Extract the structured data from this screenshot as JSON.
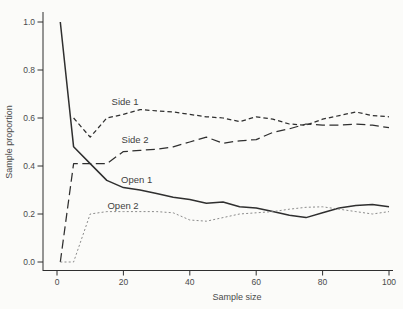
{
  "figure": {
    "background": "#fbfbf9",
    "line_color": "#2f2f2f",
    "muted_line_color": "#8b8b8b",
    "text_color": "#4a4a4a"
  },
  "chart_data": {
    "type": "line",
    "title": "",
    "xlabel": "Sample size",
    "ylabel": "Sample proportion",
    "xlim": [
      0,
      100
    ],
    "ylim": [
      0.0,
      1.0
    ],
    "grid": false,
    "legend": "inline-labels",
    "x_ticks": [
      "0",
      "20",
      "40",
      "60",
      "80",
      "100"
    ],
    "x_tick_values": [
      0,
      20,
      40,
      60,
      80,
      100
    ],
    "y_ticks": [
      "0.0",
      "0.2",
      "0.4",
      "0.6",
      "0.8",
      "1.0"
    ],
    "y_tick_values": [
      0,
      0.2,
      0.4,
      0.6,
      0.8,
      1.0
    ],
    "series": [
      {
        "name": "Side 1",
        "line_style": "short-dash",
        "dash": "4.5 3",
        "width": 1.25,
        "color": "#2f2f2f",
        "label_at": {
          "x": 20.5,
          "y": 0.665
        },
        "points": [
          [
            5,
            0.6
          ],
          [
            10,
            0.52
          ],
          [
            15,
            0.6
          ],
          [
            20,
            0.615
          ],
          [
            25,
            0.635
          ],
          [
            30,
            0.63
          ],
          [
            35,
            0.625
          ],
          [
            40,
            0.615
          ],
          [
            45,
            0.605
          ],
          [
            50,
            0.6
          ],
          [
            55,
            0.585
          ],
          [
            60,
            0.605
          ],
          [
            65,
            0.595
          ],
          [
            70,
            0.575
          ],
          [
            75,
            0.57
          ],
          [
            80,
            0.595
          ],
          [
            85,
            0.61
          ],
          [
            90,
            0.625
          ],
          [
            95,
            0.61
          ],
          [
            100,
            0.605
          ]
        ]
      },
      {
        "name": "Side 2",
        "line_style": "long-dash",
        "dash": "9 4.5",
        "width": 1.25,
        "color": "#2f2f2f",
        "label_at": {
          "x": 23.5,
          "y": 0.508
        },
        "points": [
          [
            1,
            0.0
          ],
          [
            5,
            0.41
          ],
          [
            10,
            0.41
          ],
          [
            15,
            0.41
          ],
          [
            20,
            0.46
          ],
          [
            25,
            0.465
          ],
          [
            30,
            0.47
          ],
          [
            35,
            0.48
          ],
          [
            40,
            0.5
          ],
          [
            45,
            0.52
          ],
          [
            50,
            0.495
          ],
          [
            55,
            0.505
          ],
          [
            60,
            0.51
          ],
          [
            65,
            0.54
          ],
          [
            70,
            0.555
          ],
          [
            75,
            0.575
          ],
          [
            80,
            0.57
          ],
          [
            85,
            0.57
          ],
          [
            90,
            0.575
          ],
          [
            95,
            0.57
          ],
          [
            100,
            0.56
          ]
        ]
      },
      {
        "name": "Open 1",
        "line_style": "solid",
        "dash": "",
        "width": 1.5,
        "color": "#2f2f2f",
        "label_at": {
          "x": 24.0,
          "y": 0.342
        },
        "points": [
          [
            1,
            1.0
          ],
          [
            5,
            0.48
          ],
          [
            10,
            0.41
          ],
          [
            15,
            0.34
          ],
          [
            20,
            0.31
          ],
          [
            25,
            0.3
          ],
          [
            30,
            0.285
          ],
          [
            35,
            0.27
          ],
          [
            40,
            0.26
          ],
          [
            45,
            0.245
          ],
          [
            50,
            0.25
          ],
          [
            55,
            0.23
          ],
          [
            60,
            0.225
          ],
          [
            65,
            0.21
          ],
          [
            70,
            0.195
          ],
          [
            75,
            0.185
          ],
          [
            80,
            0.205
          ],
          [
            85,
            0.225
          ],
          [
            90,
            0.235
          ],
          [
            95,
            0.24
          ],
          [
            100,
            0.23
          ]
        ]
      },
      {
        "name": "Open 2",
        "line_style": "dotted",
        "dash": "2 2.2",
        "width": 1.0,
        "color": "#8b8b8b",
        "label_at": {
          "x": 19.9,
          "y": 0.233
        },
        "points": [
          [
            1,
            0.0
          ],
          [
            5,
            0.0
          ],
          [
            10,
            0.2
          ],
          [
            15,
            0.21
          ],
          [
            20,
            0.21
          ],
          [
            25,
            0.21
          ],
          [
            30,
            0.21
          ],
          [
            35,
            0.205
          ],
          [
            40,
            0.175
          ],
          [
            45,
            0.17
          ],
          [
            50,
            0.185
          ],
          [
            55,
            0.2
          ],
          [
            60,
            0.205
          ],
          [
            65,
            0.21
          ],
          [
            70,
            0.22
          ],
          [
            75,
            0.228
          ],
          [
            80,
            0.23
          ],
          [
            85,
            0.22
          ],
          [
            90,
            0.21
          ],
          [
            95,
            0.2
          ],
          [
            100,
            0.21
          ]
        ]
      }
    ]
  }
}
